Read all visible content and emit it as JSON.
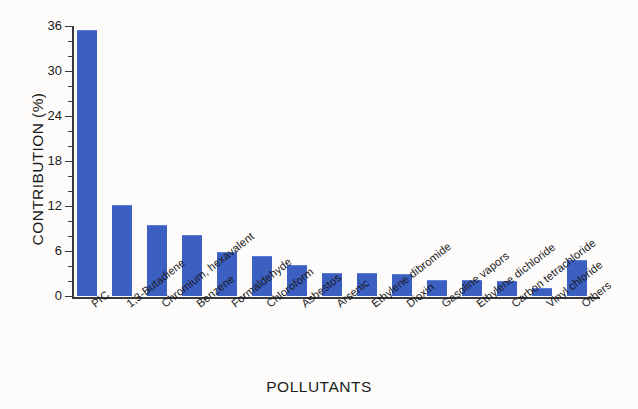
{
  "chart_data": {
    "type": "bar",
    "title": "",
    "xlabel": "POLLUTANTS",
    "ylabel": "CONTRIBUTION (%)",
    "ylim": [
      0,
      36
    ],
    "yticks": [
      0,
      6,
      12,
      18,
      24,
      30,
      36
    ],
    "ytick_labels": [
      "0",
      "6",
      "12",
      "18",
      "24",
      "30",
      "36"
    ],
    "grid": false,
    "legend": null,
    "bar_color": "#3c5fc2",
    "categories": [
      "PIC",
      "1,3-Butadiene",
      "Chromium, hexavalent",
      "Benzene",
      "Formaldehyde",
      "Chloroform",
      "Asbestos",
      "Arsenic",
      "Ethylene dibromide",
      "Dioxin",
      "Gasoline vapors",
      "Ethylene dichloride",
      "Carbon tetrachloride",
      "Vinyl chloride",
      "Others"
    ],
    "values": [
      35.4,
      12.0,
      9.4,
      8.1,
      5.8,
      5.3,
      4.1,
      3.0,
      3.0,
      2.9,
      2.0,
      2.0,
      1.9,
      1.0,
      4.7
    ]
  }
}
